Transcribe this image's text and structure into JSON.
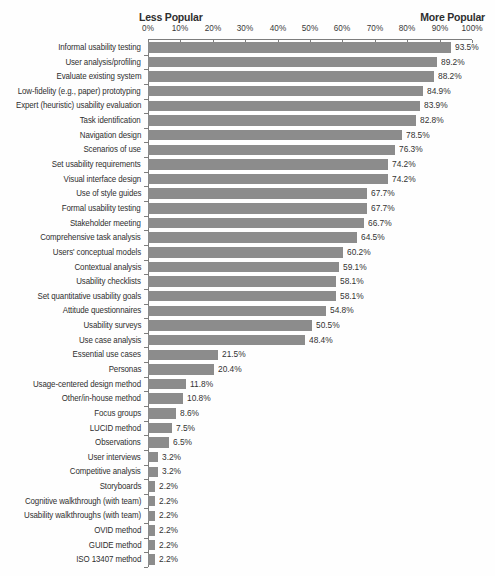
{
  "header": {
    "left_label": "Less Popular",
    "right_label": "More Popular"
  },
  "axis": {
    "tick_labels": [
      "0%",
      "10%",
      "20%",
      "30%",
      "40%",
      "50%",
      "60%",
      "70%",
      "80%",
      "90%",
      "100%"
    ]
  },
  "colors": {
    "bar": "#8c8c8c",
    "axis": "#7d7d7d",
    "text": "#2e2e2e"
  },
  "chart_data": {
    "type": "bar",
    "orientation": "horizontal",
    "title": "",
    "xlabel": "",
    "ylabel": "",
    "xlim": [
      0,
      100
    ],
    "x_ticks_percent": [
      0,
      10,
      20,
      30,
      40,
      50,
      60,
      70,
      80,
      90,
      100
    ],
    "grid": false,
    "legend": "none",
    "value_label_suffix": "%",
    "categories": [
      "Informal usability testing",
      "User analysis/profiling",
      "Evaluate existing system",
      "Low-fidelity (e.g., paper) prototyping",
      "Expert (heuristic) usability evaluation",
      "Task identification",
      "Navigation design",
      "Scenarios of use",
      "Set usability requirements",
      "Visual interface design",
      "Use of style guides",
      "Formal usability testing",
      "Stakeholder meeting",
      "Comprehensive task analysis",
      "Users' conceptual models",
      "Contextual analysis",
      "Usability checklists",
      "Set quantitative usability goals",
      "Attitude questionnaires",
      "Usability surveys",
      "Use case analysis",
      "Essential use cases",
      "Personas",
      "Usage-centered design method",
      "Other/in-house method",
      "Focus groups",
      "LUCID method",
      "Observations",
      "User interviews",
      "Competitive analysis",
      "Storyboards",
      "Cognitive walkthrough (with team)",
      "Usability walkthroughs (with team)",
      "OVID method",
      "GUIDE method",
      "ISO 13407 method"
    ],
    "values": [
      93.5,
      89.2,
      88.2,
      84.9,
      83.9,
      82.8,
      78.5,
      76.3,
      74.2,
      74.2,
      67.7,
      67.7,
      66.7,
      64.5,
      60.2,
      59.1,
      58.1,
      58.1,
      54.8,
      50.5,
      48.4,
      21.5,
      20.4,
      11.8,
      10.8,
      8.6,
      7.5,
      6.5,
      3.2,
      3.2,
      2.2,
      2.2,
      2.2,
      2.2,
      2.2,
      2.2
    ]
  }
}
